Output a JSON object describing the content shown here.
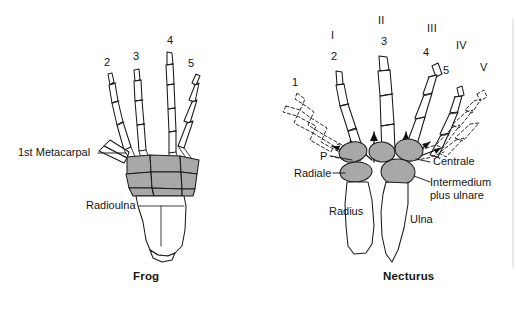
{
  "figure": {
    "background_color": "#ffffff",
    "ink_color": "#141414",
    "carpal_fill_color": "#a8a8a8",
    "bone_fill_color": "#ffffff"
  },
  "frog": {
    "caption": "Frog",
    "digit_labels": [
      {
        "text": "2",
        "x": 104,
        "y": 62
      },
      {
        "text": "3",
        "x": 133,
        "y": 56
      },
      {
        "text": "4",
        "x": 167,
        "y": 40
      },
      {
        "text": "5",
        "x": 188,
        "y": 63
      }
    ],
    "part_labels": [
      {
        "text": "1st Metacarpal",
        "x": 18,
        "y": 148
      },
      {
        "text": "Radioulna",
        "x": 86,
        "y": 201
      }
    ],
    "caption_pos": {
      "x": 133,
      "y": 272
    }
  },
  "necturus": {
    "caption": "Necturus",
    "roman_labels": [
      {
        "text": "I",
        "x": 331,
        "y": 35
      },
      {
        "text": "II",
        "x": 380,
        "y": 19
      },
      {
        "text": "III",
        "x": 429,
        "y": 27
      },
      {
        "text": "IV",
        "x": 458,
        "y": 44
      },
      {
        "text": "V",
        "x": 481,
        "y": 66
      }
    ],
    "digit_labels": [
      {
        "text": "1",
        "x": 292,
        "y": 81
      },
      {
        "text": "2",
        "x": 331,
        "y": 56
      },
      {
        "text": "3",
        "x": 382,
        "y": 41
      },
      {
        "text": "4",
        "x": 424,
        "y": 52
      },
      {
        "text": "5",
        "x": 444,
        "y": 70
      }
    ],
    "part_labels": [
      {
        "text": "P",
        "x": 321,
        "y": 152
      },
      {
        "text": "Radiale",
        "x": 296,
        "y": 170
      },
      {
        "text": "Centrale",
        "x": 434,
        "y": 158
      },
      {
        "text": "Radius",
        "x": 330,
        "y": 207
      },
      {
        "text": "Ulna",
        "x": 411,
        "y": 215
      }
    ],
    "part_labels_multiline": [
      {
        "line1": "Intermedium",
        "line2": "plus ulnare",
        "x": 430,
        "y": 178
      }
    ],
    "caption_pos": {
      "x": 383,
      "y": 272
    }
  }
}
